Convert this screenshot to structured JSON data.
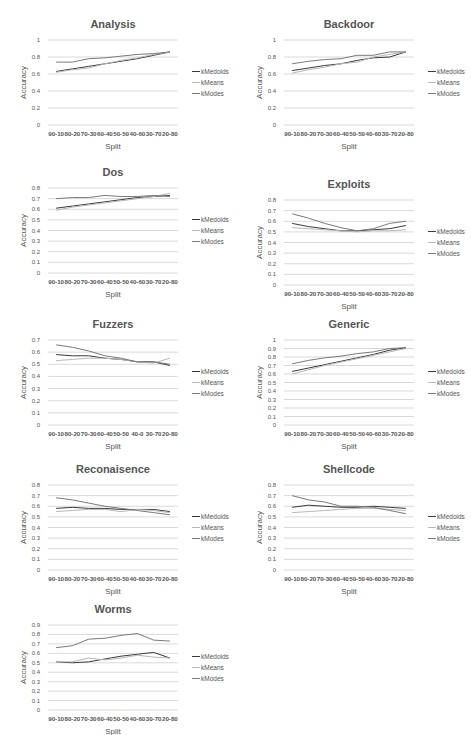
{
  "chart_data": [
    {
      "type": "line",
      "title": "Analysis",
      "categories": [
        "90-10",
        "80-20",
        "70-30",
        "60-40",
        "50-50",
        "40-60",
        "30-70",
        "20-80"
      ],
      "xlabel": "Split",
      "ylabel": "Accuracy",
      "yticks": [
        "0",
        "0.2",
        "0.4",
        "0.6",
        "0.8",
        "1"
      ],
      "ylim": [
        0,
        1
      ],
      "grid": true,
      "legend_position": "right",
      "series": [
        {
          "name": "kMedoids",
          "values": [
            0.63,
            0.66,
            0.69,
            0.72,
            0.75,
            0.78,
            0.82,
            0.86
          ]
        },
        {
          "name": "kMeans",
          "values": [
            0.62,
            0.65,
            0.67,
            0.72,
            0.76,
            0.79,
            0.83,
            0.86
          ]
        },
        {
          "name": "kModes",
          "values": [
            0.74,
            0.74,
            0.78,
            0.79,
            0.81,
            0.83,
            0.84,
            0.86
          ]
        }
      ]
    },
    {
      "type": "line",
      "title": "Backdoor",
      "categories": [
        "90-10",
        "80-20",
        "70-30",
        "60-40",
        "50-50",
        "40-60",
        "30-70",
        "20-80"
      ],
      "xlabel": "Split",
      "ylabel": "Accuracy",
      "yticks": [
        "0",
        "0.2",
        "0.4",
        "0.6",
        "0.8",
        "1"
      ],
      "ylim": [
        0,
        1
      ],
      "grid": true,
      "legend_position": "right",
      "series": [
        {
          "name": "kMedoids",
          "values": [
            0.64,
            0.67,
            0.7,
            0.72,
            0.76,
            0.79,
            0.8,
            0.86
          ]
        },
        {
          "name": "kMeans",
          "values": [
            0.61,
            0.65,
            0.68,
            0.72,
            0.74,
            0.8,
            0.83,
            0.86
          ]
        },
        {
          "name": "kModes",
          "values": [
            0.72,
            0.75,
            0.77,
            0.78,
            0.82,
            0.82,
            0.86,
            0.86
          ]
        }
      ]
    },
    {
      "type": "line",
      "title": "Dos",
      "categories": [
        "90-10",
        "80-20",
        "70-30",
        "60-40",
        "50-50",
        "40-60",
        "30-70",
        "20-80"
      ],
      "xlabel": "Split",
      "ylabel": "Accuracy",
      "yticks": [
        "0",
        "0.1",
        "0.2",
        "0.3",
        "0.4",
        "0.5",
        "0.6",
        "0.7",
        "0.8"
      ],
      "ylim": [
        0,
        0.8
      ],
      "grid": true,
      "legend_position": "right",
      "series": [
        {
          "name": "kMedoids",
          "values": [
            0.61,
            0.63,
            0.65,
            0.67,
            0.69,
            0.71,
            0.72,
            0.73
          ]
        },
        {
          "name": "kMeans",
          "values": [
            0.59,
            0.62,
            0.64,
            0.66,
            0.68,
            0.7,
            0.72,
            0.75
          ]
        },
        {
          "name": "kModes",
          "values": [
            0.7,
            0.71,
            0.71,
            0.73,
            0.72,
            0.72,
            0.73,
            0.72
          ]
        }
      ]
    },
    {
      "type": "line",
      "title": "Exploits",
      "categories": [
        "90-10",
        "80-20",
        "70-30",
        "60-40",
        "50-50",
        "40-60",
        "30-70",
        "20-80"
      ],
      "xlabel": "Split",
      "ylabel": "Accuracy",
      "yticks": [
        "0",
        "0.1",
        "0.2",
        "0.3",
        "0.4",
        "0.5",
        "0.6",
        "0.7",
        "0.8"
      ],
      "ylim": [
        0,
        0.8
      ],
      "grid": true,
      "legend_position": "right",
      "series": [
        {
          "name": "kMedoids",
          "values": [
            0.58,
            0.55,
            0.53,
            0.51,
            0.51,
            0.52,
            0.53,
            0.56
          ]
        },
        {
          "name": "kMeans",
          "values": [
            0.54,
            0.53,
            0.52,
            0.51,
            0.5,
            0.51,
            0.51,
            0.52
          ]
        },
        {
          "name": "kModes",
          "values": [
            0.67,
            0.63,
            0.58,
            0.54,
            0.51,
            0.53,
            0.58,
            0.6
          ]
        }
      ]
    },
    {
      "type": "line",
      "title": "Fuzzers",
      "categories": [
        "90-10",
        "80-20",
        "70-30",
        "60-40",
        "50-50",
        "40-0",
        "30-70",
        "20-80"
      ],
      "xlabel": "Split",
      "ylabel": "Accuracy",
      "yticks": [
        "0",
        "0.1",
        "0.2",
        "0.3",
        "0.4",
        "0.5",
        "0.6",
        "0.7"
      ],
      "ylim": [
        0,
        0.7
      ],
      "grid": true,
      "legend_position": "right",
      "series": [
        {
          "name": "kMedoids",
          "values": [
            0.58,
            0.57,
            0.57,
            0.55,
            0.54,
            0.52,
            0.52,
            0.49
          ]
        },
        {
          "name": "kMeans",
          "values": [
            0.53,
            0.54,
            0.55,
            0.55,
            0.54,
            0.52,
            0.51,
            0.55
          ]
        },
        {
          "name": "kModes",
          "values": [
            0.66,
            0.64,
            0.61,
            0.57,
            0.55,
            0.52,
            0.52,
            0.5
          ]
        }
      ]
    },
    {
      "type": "line",
      "title": "Generic",
      "categories": [
        "90-10",
        "80-20",
        "70-30",
        "60-40",
        "50-50",
        "40-60",
        "30-70",
        "20-80"
      ],
      "xlabel": "Split",
      "ylabel": "Accuracy",
      "yticks": [
        "0",
        "0.1",
        "0.2",
        "0.3",
        "0.4",
        "0.5",
        "0.6",
        "0.7",
        "0.8",
        "0.9",
        "1"
      ],
      "ylim": [
        0,
        1
      ],
      "grid": true,
      "legend_position": "right",
      "series": [
        {
          "name": "kMedoids",
          "values": [
            0.63,
            0.67,
            0.71,
            0.75,
            0.79,
            0.83,
            0.88,
            0.91
          ]
        },
        {
          "name": "kMeans",
          "values": [
            0.6,
            0.65,
            0.7,
            0.74,
            0.78,
            0.82,
            0.86,
            0.9
          ]
        },
        {
          "name": "kModes",
          "values": [
            0.72,
            0.76,
            0.79,
            0.81,
            0.84,
            0.86,
            0.9,
            0.91
          ]
        }
      ]
    },
    {
      "type": "line",
      "title": "Reconaisence",
      "categories": [
        "90-10",
        "80-20",
        "70-30",
        "60-40",
        "50-50",
        "40-60",
        "30-70",
        "20-80"
      ],
      "xlabel": "Split",
      "ylabel": "Accuracy",
      "yticks": [
        "0",
        "0.1",
        "0.2",
        "0.3",
        "0.4",
        "0.5",
        "0.6",
        "0.7",
        "0.8"
      ],
      "ylim": [
        0,
        0.8
      ],
      "grid": true,
      "legend_position": "right",
      "series": [
        {
          "name": "kMedoids",
          "values": [
            0.58,
            0.59,
            0.58,
            0.58,
            0.57,
            0.57,
            0.57,
            0.55
          ]
        },
        {
          "name": "kMeans",
          "values": [
            0.55,
            0.56,
            0.57,
            0.57,
            0.55,
            0.57,
            0.56,
            0.54
          ]
        },
        {
          "name": "kModes",
          "values": [
            0.68,
            0.66,
            0.63,
            0.6,
            0.58,
            0.56,
            0.54,
            0.52
          ]
        }
      ]
    },
    {
      "type": "line",
      "title": "Shellcode",
      "categories": [
        "90-10",
        "80-20",
        "70-30",
        "60-40",
        "50-50",
        "40-60",
        "30-70",
        "20-80"
      ],
      "xlabel": "Split",
      "ylabel": "Accuracy",
      "yticks": [
        "0",
        "0.1",
        "0.2",
        "0.3",
        "0.4",
        "0.5",
        "0.6",
        "0.7",
        "0.8"
      ],
      "ylim": [
        0,
        0.8
      ],
      "grid": true,
      "legend_position": "right",
      "series": [
        {
          "name": "kMedoids",
          "values": [
            0.59,
            0.61,
            0.6,
            0.59,
            0.59,
            0.6,
            0.59,
            0.58
          ]
        },
        {
          "name": "kMeans",
          "values": [
            0.54,
            0.55,
            0.56,
            0.57,
            0.58,
            0.58,
            0.57,
            0.56
          ]
        },
        {
          "name": "kModes",
          "values": [
            0.7,
            0.66,
            0.64,
            0.6,
            0.6,
            0.59,
            0.56,
            0.53
          ]
        }
      ]
    },
    {
      "type": "line",
      "title": "Worms",
      "categories": [
        "90-10",
        "80-20",
        "70-30",
        "60-40",
        "50-50",
        "40-60",
        "30-70",
        "20-80"
      ],
      "xlabel": "Split",
      "ylabel": "Accuracy",
      "yticks": [
        "0",
        "0.1",
        "0.2",
        "0.3",
        "0.4",
        "0.5",
        "0.6",
        "0.7",
        "0.8",
        "0.9"
      ],
      "ylim": [
        0,
        0.9
      ],
      "grid": true,
      "legend_position": "right",
      "series": [
        {
          "name": "kMedoids",
          "values": [
            0.51,
            0.5,
            0.51,
            0.54,
            0.57,
            0.59,
            0.61,
            0.55
          ]
        },
        {
          "name": "kMeans",
          "values": [
            0.51,
            0.51,
            0.55,
            0.53,
            0.55,
            0.58,
            0.56,
            0.55
          ]
        },
        {
          "name": "kModes",
          "values": [
            0.66,
            0.68,
            0.75,
            0.76,
            0.79,
            0.81,
            0.74,
            0.73
          ]
        }
      ]
    }
  ],
  "layout": {
    "positions": [
      {
        "x": 0,
        "y": 0
      },
      {
        "x": 236,
        "y": 0
      },
      {
        "x": 0,
        "y": 148
      },
      {
        "x": 236,
        "y": 160
      },
      {
        "x": 0,
        "y": 300
      },
      {
        "x": 236,
        "y": 300
      },
      {
        "x": 0,
        "y": 445
      },
      {
        "x": 236,
        "y": 445
      },
      {
        "x": 0,
        "y": 585
      }
    ],
    "series_colors": [
      "#3a3a3a",
      "#b8b8b8",
      "#7a7a7a"
    ]
  }
}
